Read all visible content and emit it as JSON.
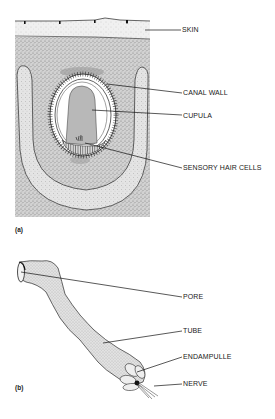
{
  "figure": {
    "panel_a": {
      "tag": "(a)",
      "labels": {
        "skin": "SKIN",
        "canal_wall": "CANAL WALL",
        "cupula": "CUPULA",
        "sensory_hair_cells": "SENSORY HAIR CELLS"
      }
    },
    "panel_b": {
      "tag": "(b)",
      "labels": {
        "pore": "PORE",
        "tube": "TUBE",
        "endampulle": "ENDAMPULLE",
        "nerve": "NERVE"
      }
    }
  },
  "colors": {
    "ink": "#1a1a1a",
    "skin_fill": "#efefef",
    "tissue_fill": "#c9c9c9",
    "canal_fill": "#e6e6e6",
    "cupula_fill": "#b5b5b5",
    "lumen_fill": "#ffffff"
  }
}
